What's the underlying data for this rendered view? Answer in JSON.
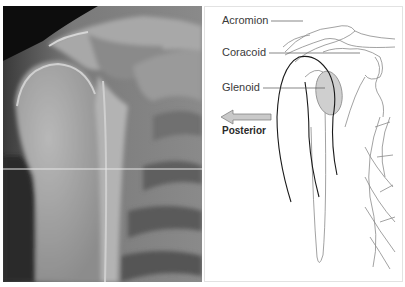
{
  "figure": {
    "left_panel": {
      "type": "radiograph",
      "subject": "shoulder-scapular-y-view"
    },
    "right_panel": {
      "type": "line-drawing",
      "labels": [
        {
          "id": "acromion",
          "text": "Acromion"
        },
        {
          "id": "coracoid",
          "text": "Coracoid"
        },
        {
          "id": "glenoid",
          "text": "Glenoid"
        }
      ],
      "direction": {
        "text": "Posterior",
        "arrow": "left-arrow-icon"
      },
      "colors": {
        "glenoid_fill": "#cfcfcf",
        "outline": "#1a1a1a",
        "bone_lines": "#8a8a8a",
        "arrow_fill": "#c9c9c9"
      }
    }
  }
}
